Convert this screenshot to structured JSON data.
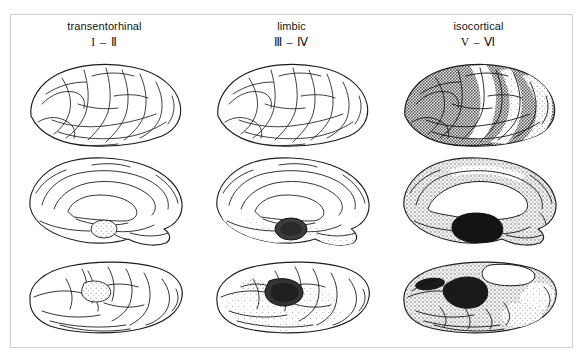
{
  "figure": {
    "title_visible": false,
    "background_color": "#ffffff",
    "border_color": "#cfcfcf",
    "ink_color": "#1a1a1a"
  },
  "columns": [
    {
      "id": "transentorhinal",
      "label": "transentorhinal",
      "stage": "I – Ⅱ"
    },
    {
      "id": "limbic",
      "label": "limbic",
      "stage": "Ⅲ – Ⅳ"
    },
    {
      "id": "isocortical",
      "label": "isocortical",
      "stage": "V – Ⅵ"
    }
  ],
  "rows": [
    {
      "id": "lateral",
      "view": "lateral-view"
    },
    {
      "id": "medial",
      "view": "medial-view"
    },
    {
      "id": "basal",
      "view": "basal-view"
    }
  ],
  "panels": [
    {
      "row": "lateral",
      "column": "transentorhinal",
      "name": "brain-lateral-transentorhinal",
      "shading": "none",
      "cortex_tone": "#ffffff",
      "deep_tone": "#ffffff"
    },
    {
      "row": "lateral",
      "column": "limbic",
      "name": "brain-lateral-limbic",
      "shading": "none",
      "cortex_tone": "#ffffff",
      "deep_tone": "#ffffff"
    },
    {
      "row": "lateral",
      "column": "isocortical",
      "name": "brain-lateral-isocortical",
      "shading": "heavy-stipple",
      "cortex_tone": "#9a9a9a",
      "deep_tone": "#d8d8d8"
    },
    {
      "row": "medial",
      "column": "transentorhinal",
      "name": "brain-medial-transentorhinal",
      "shading": "focal-light",
      "cortex_tone": "#ffffff",
      "deep_tone": "#d9d9d9"
    },
    {
      "row": "medial",
      "column": "limbic",
      "name": "brain-medial-limbic",
      "shading": "focal-dark-plus-light",
      "cortex_tone": "#f0f0f0",
      "deep_tone": "#3a3a3a"
    },
    {
      "row": "medial",
      "column": "isocortical",
      "name": "brain-medial-isocortical",
      "shading": "heavy-stipple",
      "cortex_tone": "#9c9c9c",
      "deep_tone": "#1e1e1e"
    },
    {
      "row": "basal",
      "column": "transentorhinal",
      "name": "brain-basal-transentorhinal",
      "shading": "focal-light",
      "cortex_tone": "#ffffff",
      "deep_tone": "#d0d0d0"
    },
    {
      "row": "basal",
      "column": "limbic",
      "name": "brain-basal-limbic",
      "shading": "focal-dark-plus-light",
      "cortex_tone": "#ececec",
      "deep_tone": "#343434"
    },
    {
      "row": "basal",
      "column": "isocortical",
      "name": "brain-basal-isocortical",
      "shading": "heavy-stipple",
      "cortex_tone": "#8f8f8f",
      "deep_tone": "#181818"
    }
  ]
}
